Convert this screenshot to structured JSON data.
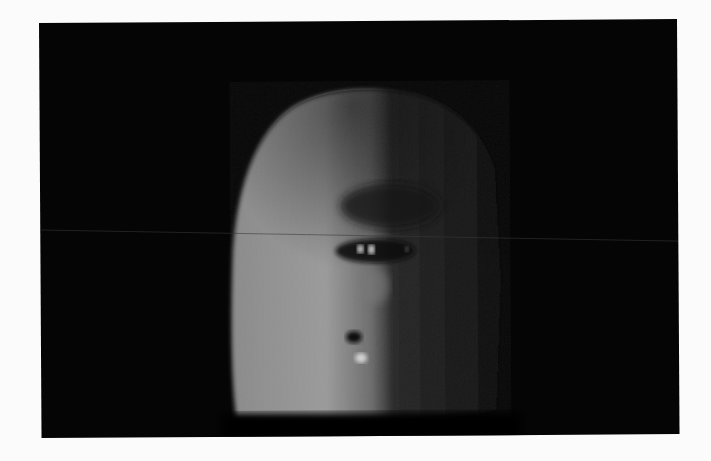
{
  "image": {
    "description": "Dark photograph of a half-lit face-like sculpture on black background",
    "colors": {
      "border": "#fbfbfb",
      "background": "#050505",
      "highlight": "#b5b5b5",
      "shadow": "#161616"
    }
  }
}
